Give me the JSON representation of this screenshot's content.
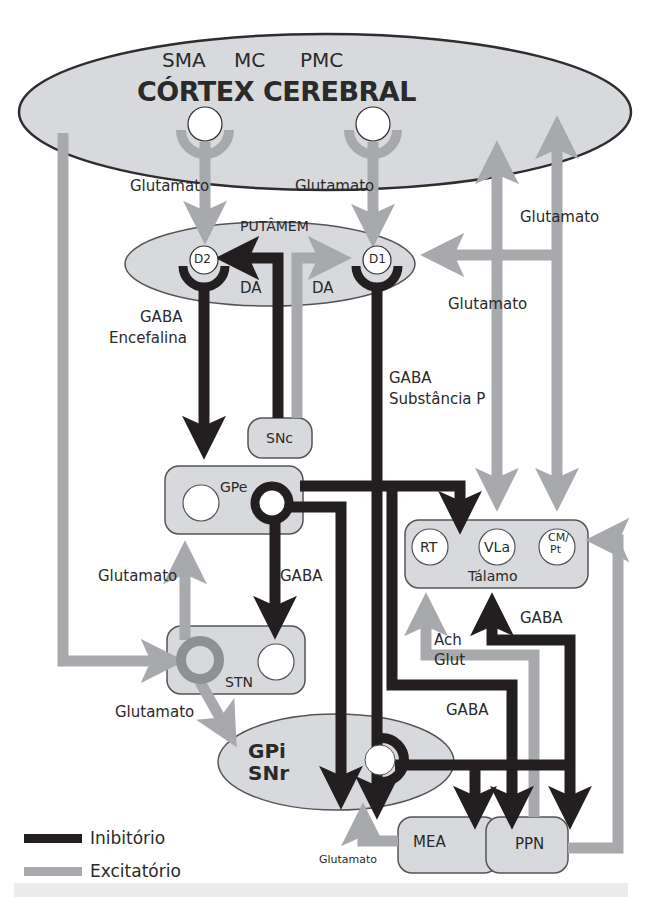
{
  "colors": {
    "inhibitory": "#231f20",
    "excitatory": "#a7a9ac",
    "structure_fill": "#d7d9dc",
    "outline": "#2e2e2e",
    "background": "#ffffff"
  },
  "cortex": {
    "title": "CÓRTEX CEREBRAL",
    "areas": [
      "SMA",
      "MC",
      "PMC"
    ]
  },
  "putamen": {
    "label": "PUTÂMEM",
    "receptors": [
      "D2",
      "D1"
    ]
  },
  "snc": {
    "label": "SNc"
  },
  "gpe": {
    "label": "GPe"
  },
  "stn": {
    "label": "STN"
  },
  "gpi": {
    "line1": "GPi",
    "line2": "SNr"
  },
  "thalamus": {
    "label": "Tálamo",
    "nuclei": [
      "RT",
      "VLa",
      "CM/",
      "Pt"
    ]
  },
  "mea": {
    "label": "MEA"
  },
  "ppn": {
    "label": "PPN"
  },
  "pathway_labels": {
    "glu_sma": "Glutamato",
    "glu_pmc": "Glutamato",
    "glu_right_top": "Glutamato",
    "glu_right_mid": "Glutamato",
    "da_left": "DA",
    "da_right": "DA",
    "gaba_indirect_1": "GABA",
    "gaba_indirect_2": "Encefalina",
    "gaba_direct_1": "GABA",
    "gaba_direct_2": "Substância P",
    "glu_stn_gpe": "Glutamato",
    "gaba_gpe_stn": "GABA",
    "glu_stn_gpi": "Glutamato",
    "ach": "Ach",
    "glut": "Glut",
    "gaba_ppn_thal": "GABA",
    "gaba_gpi_ppn": "GABA",
    "glu_mea": "Glutamato"
  },
  "legend": {
    "items": [
      {
        "label": "Inibitório",
        "type": "inhibitory"
      },
      {
        "label": "Excitatório",
        "type": "excitatory"
      }
    ]
  }
}
